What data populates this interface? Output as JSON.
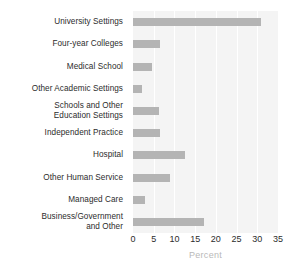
{
  "chart_data": {
    "type": "bar",
    "orientation": "horizontal",
    "title": "",
    "xlabel": "Percent",
    "ylabel": "",
    "xlim": [
      0,
      35
    ],
    "xticks": [
      0,
      5,
      10,
      15,
      20,
      25,
      30,
      35
    ],
    "xtick_labels": [
      "0",
      "5",
      "10",
      "15",
      "20",
      "25",
      "30",
      "35"
    ],
    "grid": true,
    "grid_axis": "x",
    "legend": false,
    "plot_background": "#f4f4f4",
    "bar_color": "#b4b4b4",
    "gridline_color": "#ffffff",
    "categories": [
      "University Settings",
      "Four-year Colleges",
      "Medical School",
      "Other Academic Settings",
      "Schools and Other Education Settings",
      "Independent Practice",
      "Hospital",
      "Other Human Service",
      "Managed Care",
      "Business/Government and Other"
    ],
    "category_lines": [
      [
        "University Settings"
      ],
      [
        "Four-year Colleges"
      ],
      [
        "Medical School"
      ],
      [
        "Other Academic Settings"
      ],
      [
        "Schools and Other",
        "Education Settings"
      ],
      [
        "Independent Practice"
      ],
      [
        "Hospital"
      ],
      [
        "Other Human Service"
      ],
      [
        "Managed Care"
      ],
      [
        "Business/Government",
        "and Other"
      ]
    ],
    "values": [
      31,
      6.5,
      4.6,
      2.2,
      6.3,
      6.6,
      12.6,
      8.9,
      2.9,
      17.1
    ]
  }
}
